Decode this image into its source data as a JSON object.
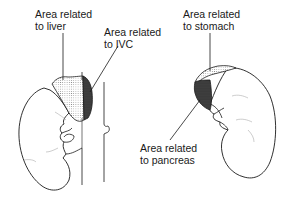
{
  "diagram": {
    "labels": {
      "liver": {
        "line1": "Area related",
        "line2": "to liver"
      },
      "ivc": {
        "line1": "Area related",
        "line2": "to IVC"
      },
      "stomach": {
        "line1": "Area related",
        "line2": "to stomach"
      },
      "pancreas": {
        "line1": "Area related",
        "line2": "to pancreas"
      }
    },
    "structures": [
      {
        "name": "right-kidney",
        "side": "left"
      },
      {
        "name": "right-suprarenal-gland",
        "side": "left"
      },
      {
        "name": "inferior-vena-cava",
        "side": "left"
      },
      {
        "name": "left-kidney",
        "side": "right"
      },
      {
        "name": "left-suprarenal-gland",
        "side": "right"
      }
    ],
    "colors": {
      "line": "#1a1a1a",
      "stipple_light": "#b8b8b8",
      "stipple_dark": "#2a2a2a",
      "background": "#ffffff"
    }
  }
}
